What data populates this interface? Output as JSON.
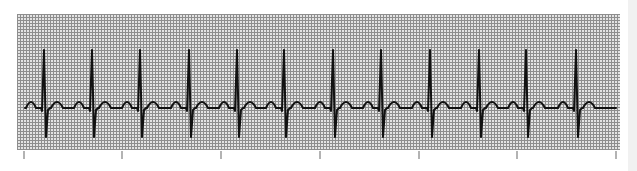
{
  "chart_data": {
    "type": "line",
    "title": "",
    "subtitle": "",
    "xlabel": "",
    "ylabel": "",
    "grid": true,
    "legend": null,
    "beat_count": 12,
    "r_peak_x_px": [
      44,
      92,
      140,
      189,
      237,
      284,
      333,
      381,
      430,
      479,
      526,
      576
    ],
    "rr_interval_px": 48.4,
    "time_ticks_x_px": [
      24,
      122,
      221,
      320,
      419,
      517,
      616
    ],
    "time_tick_labels": [
      "",
      "",
      "",
      "",
      "",
      "",
      ""
    ],
    "waveform": {
      "baseline_y_px": 108,
      "r_peak_y_px": 50,
      "s_trough_y_px": 137,
      "p_wave_height_px": 6,
      "t_wave_height_px": 6,
      "p_offset_before_r_px": 13,
      "t_offset_after_r_px": 13
    },
    "plot_area_px": {
      "x0": 17,
      "y0": 14,
      "x1": 620,
      "y1": 150
    },
    "colors": {
      "background": "#ffffff",
      "grid_fill": "#e4e4e4",
      "grid_line": "#8e8e8e",
      "trace": "#111111",
      "tick": "#9a9a9a",
      "edge_strip": "#f1f1f1"
    }
  }
}
